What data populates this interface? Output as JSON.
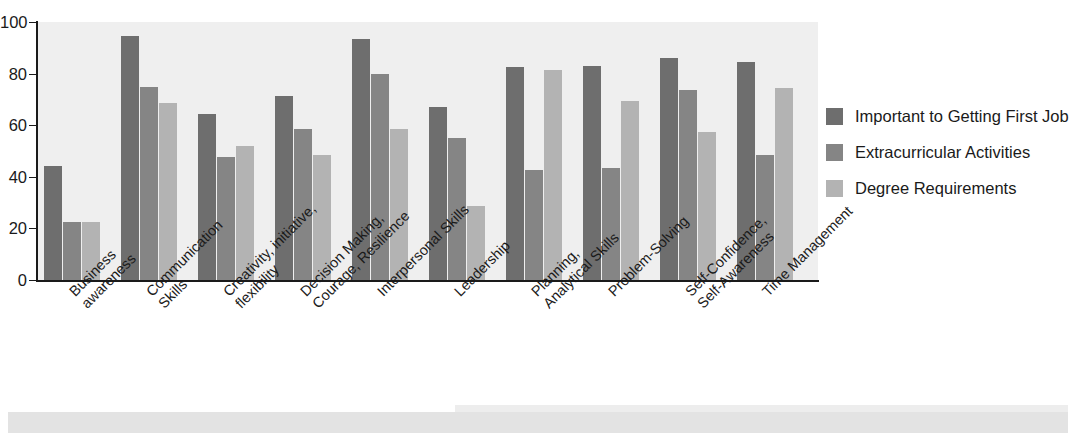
{
  "chart_data": {
    "type": "bar",
    "title": "",
    "xlabel": "",
    "ylabel": "",
    "ylim": [
      0,
      100
    ],
    "yticks": [
      0,
      20,
      40,
      60,
      80,
      100
    ],
    "grid": false,
    "legend_position": "right",
    "categories": [
      "Business awareness",
      "Communication Skills",
      "Creativity, initiative, flexibility",
      "Decision Making, Courage, Resilience",
      "Interpersonal Skills",
      "Leadership",
      "Planning, Analytical Skills",
      "Problem-Solving",
      "Self-Confidence, Self-Awareness",
      "Time Management"
    ],
    "category_lines": [
      [
        "Business",
        "awareness"
      ],
      [
        "Communication",
        "Skills"
      ],
      [
        "Creativity, initiative,",
        "flexibility"
      ],
      [
        "Decision Making,",
        "Courage, Resilience"
      ],
      [
        "Interpersonal Skills",
        ""
      ],
      [
        "Leadership",
        ""
      ],
      [
        "Planning,",
        "Analytical Skills"
      ],
      [
        "Problem-Solving",
        ""
      ],
      [
        "Self-Confidence,",
        "Self-Awareness"
      ],
      [
        "Time Management",
        ""
      ]
    ],
    "series": [
      {
        "name": "Important to Getting First Job",
        "color": "#6e6e6e",
        "values": [
          44,
          94.5,
          64.5,
          71.5,
          93.5,
          67,
          82.5,
          83,
          86,
          84.5
        ]
      },
      {
        "name": "Extracurricular Activities",
        "color": "#858585",
        "values": [
          22.5,
          75,
          47.5,
          58.5,
          80,
          55,
          42.5,
          43.5,
          73.5,
          48.5
        ]
      },
      {
        "name": "Degree Requirements",
        "color": "#b3b3b3",
        "values": [
          22.5,
          68.5,
          52,
          48.5,
          58.5,
          28.5,
          81.5,
          69.5,
          57.5,
          74.5
        ]
      }
    ]
  },
  "legend": {
    "items": [
      {
        "label": "Important to Getting First Job",
        "color": "#6e6e6e"
      },
      {
        "label": "Extracurricular Activities",
        "color": "#858585"
      },
      {
        "label": "Degree Requirements",
        "color": "#b3b3b3"
      }
    ]
  },
  "axis": {
    "y_tick_labels": [
      "100",
      "80",
      "60",
      "40",
      "20",
      "0"
    ]
  },
  "colors": {
    "plot_background": "#efefef",
    "axis": "#1a1a1a",
    "text": "#1a1a1a",
    "page_background": "#ffffff"
  }
}
